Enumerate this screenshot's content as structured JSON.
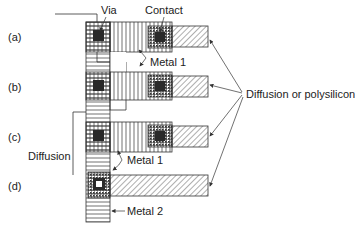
{
  "diagram": {
    "row_labels": [
      "(a)",
      "(b)",
      "(c)",
      "(d)"
    ],
    "labels": {
      "via": "Via",
      "contact": "Contact",
      "metal1_top": "Metal 1",
      "metal1_bottom": "Metal 1",
      "diffusion": "Diffusion",
      "diffusion_or_poly": "Diffusion or polysilicon",
      "metal2": "Metal 2"
    },
    "layers": {
      "metal2": "horizontal-line fill",
      "metal1": "vertical-line fill",
      "diffusion_polysilicon": "diagonal hatch fill",
      "via": "dark square",
      "contact": "dark square in dotted box"
    },
    "colors": {
      "line": "#333333",
      "via": "#2a2a2a",
      "background": "#ffffff"
    }
  }
}
